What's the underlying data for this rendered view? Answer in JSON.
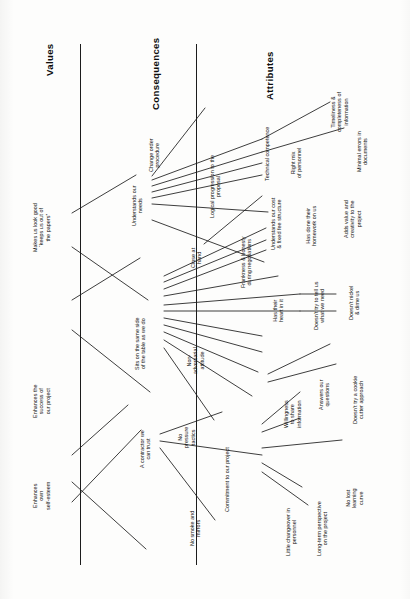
{
  "diagram": {
    "type": "hierarchical-value-map",
    "orientation": "rotated-90-ccw",
    "ink_color": "#151515",
    "paper_color": "#fdfdfc",
    "columns": [
      {
        "id": "values",
        "label": "Values"
      },
      {
        "id": "consequences",
        "label": "Consequences"
      },
      {
        "id": "attributes",
        "label": "Attributes"
      }
    ],
    "nodes": {
      "values": [
        {
          "id": "v1",
          "label": "Makes us look good\n“keeps us out of\nthe papers”"
        },
        {
          "id": "v2",
          "label": "Enhances the\nsuccess of\nour project"
        },
        {
          "id": "v3",
          "label": "Enhances\nown\nself-esteem"
        }
      ],
      "consequences": [
        {
          "id": "c1",
          "label": "Change order\nprocedure"
        },
        {
          "id": "c2",
          "label": "Understands our\nneeds"
        },
        {
          "id": "c3",
          "label": "Close at\nhand"
        },
        {
          "id": "c4",
          "label": "Sits on the same side\nof the table as we do"
        },
        {
          "id": "c5",
          "label": "Non-\nadversarial\nattitude"
        },
        {
          "id": "c6",
          "label": "No\npressure\ntactics"
        },
        {
          "id": "c7",
          "label": "A contractor we\ncan trust"
        },
        {
          "id": "c8",
          "label": "No smoke and\nmirrors"
        },
        {
          "id": "c9",
          "label": "Commitment to our project"
        }
      ],
      "attributes": [
        {
          "id": "a1",
          "label": "Logical progression to the\nproposal"
        },
        {
          "id": "a2",
          "label": "Technical competence"
        },
        {
          "id": "a3",
          "label": "Right mix\nof personnel"
        },
        {
          "id": "a4",
          "label": "Timeliness &\ncompleteness of\ninformation"
        },
        {
          "id": "a5",
          "label": "Minimal errors in\ndocuments"
        },
        {
          "id": "a6",
          "label": "Frankness & honesty\nduring negotiations"
        },
        {
          "id": "a7",
          "label": "Understands our cost\n& fixed fee structure"
        },
        {
          "id": "a8",
          "label": "Has done their\nhomework on us"
        },
        {
          "id": "a9",
          "label": "Adds value and\ncreativity to the\nproject"
        },
        {
          "id": "a10",
          "label": "Has their\nheart in it"
        },
        {
          "id": "a11",
          "label": "Doesn’t try to tell us\nwhat we need"
        },
        {
          "id": "a12",
          "label": "Doesn’t nickel\n& dime us"
        },
        {
          "id": "a13",
          "label": "Doesn’t try a cookie\ncutter approach"
        },
        {
          "id": "a14",
          "label": "Answers our\nquestions"
        },
        {
          "id": "a15",
          "label": "Willingness\nto share\ninformation"
        },
        {
          "id": "a16",
          "label": "No lost\nlearning\ncurve"
        },
        {
          "id": "a17",
          "label": "Little changeover in\npersonnel"
        },
        {
          "id": "a18",
          "label": "Long-term perspective\non the project"
        }
      ]
    }
  }
}
